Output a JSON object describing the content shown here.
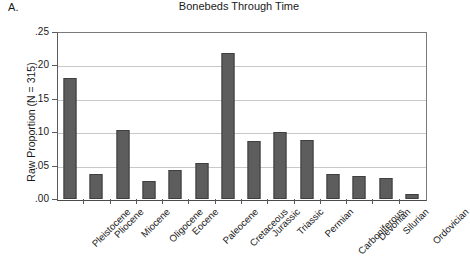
{
  "panel": {
    "letter": "A."
  },
  "chart_data": {
    "type": "bar",
    "title": "Bonebeds Through Time",
    "xlabel": "",
    "ylabel": "Raw Proportion (N = 315)",
    "ylim": [
      0.0,
      0.25
    ],
    "ytick_labels": [
      ".00",
      ".05",
      ".10",
      ".15",
      ".20",
      ".25"
    ],
    "ytick_values": [
      0.0,
      0.05,
      0.1,
      0.15,
      0.2,
      0.25
    ],
    "grid": true,
    "legend": false,
    "bar_color": "#5d5d5d",
    "categories": [
      "Pleistocene",
      "Pliocene",
      "Miocene",
      "Oligocene",
      "Eocene",
      "Paleocene",
      "Cretaceous",
      "Jurassic",
      "Triassic",
      "Permian",
      "Carboniferous",
      "Devonian",
      "Silurian",
      "Ordovician"
    ],
    "values": [
      0.181,
      0.037,
      0.103,
      0.027,
      0.044,
      0.054,
      0.219,
      0.087,
      0.1,
      0.088,
      0.037,
      0.034,
      0.031,
      0.007
    ]
  }
}
